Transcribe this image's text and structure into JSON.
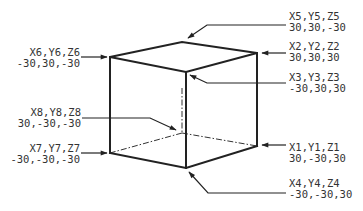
{
  "diagram": {
    "type": "cube-vertex-coordinates",
    "colors": {
      "line": "#222222",
      "text": "#333333",
      "background": "#ffffff"
    },
    "vertices": [
      {
        "id": "v1",
        "name": "X1,Y1,Z1",
        "coords": "30,-30,30",
        "pos": [
          257,
          146
        ],
        "label_pos": [
          289,
          148
        ],
        "anchor": "start"
      },
      {
        "id": "v2",
        "name": "X2,Y2,Z2",
        "coords": "30,30,30",
        "pos": [
          257,
          53
        ],
        "label_pos": [
          289,
          46
        ],
        "anchor": "start"
      },
      {
        "id": "v3",
        "name": "X3,Y3,Z3",
        "coords": "-30,30,30",
        "pos": [
          186,
          72
        ],
        "label_pos": [
          289,
          78
        ],
        "anchor": "start"
      },
      {
        "id": "v4",
        "name": "X4,Y4,Z4",
        "coords": "-30,-30,30",
        "pos": [
          186,
          168
        ],
        "label_pos": [
          289,
          183
        ],
        "anchor": "start"
      },
      {
        "id": "v5",
        "name": "X5,Y5,Z5",
        "coords": "30,30,-30",
        "pos": [
          182,
          42
        ],
        "label_pos": [
          289,
          16
        ],
        "anchor": "start"
      },
      {
        "id": "v6",
        "name": "X6,Y6,Z6",
        "coords": "-30,30,-30",
        "pos": [
          110,
          57
        ],
        "label_pos": [
          80,
          53
        ],
        "anchor": "end"
      },
      {
        "id": "v7",
        "name": "X7,Y7,Z7",
        "coords": "-30,-30,-30",
        "pos": [
          110,
          153
        ],
        "label_pos": [
          80,
          149
        ],
        "anchor": "end"
      },
      {
        "id": "v8",
        "name": "X8,Y8,Z8",
        "coords": "30,-30,-30",
        "pos": [
          182,
          133
        ],
        "label_pos": [
          81,
          112
        ],
        "anchor": "end"
      }
    ],
    "edges_solid": [
      [
        "v6",
        "v5"
      ],
      [
        "v5",
        "v2"
      ],
      [
        "v2",
        "v3"
      ],
      [
        "v3",
        "v6"
      ],
      [
        "v6",
        "v7"
      ],
      [
        "v3",
        "v4"
      ],
      [
        "v2",
        "v1"
      ],
      [
        "v7",
        "v4"
      ],
      [
        "v4",
        "v1"
      ]
    ],
    "edges_hidden": [
      [
        "v5",
        "v8"
      ],
      [
        "v8",
        "v7"
      ],
      [
        "v8",
        "v1"
      ]
    ]
  }
}
